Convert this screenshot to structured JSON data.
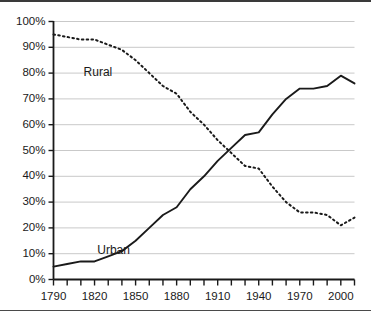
{
  "chart_data": {
    "type": "line",
    "title": "",
    "subtitle": "",
    "xlabel": "",
    "ylabel": "",
    "xlim": [
      1790,
      2010
    ],
    "ylim": [
      0,
      100
    ],
    "grid": true,
    "legend_position": "inline-annotations",
    "x_tick_labels": [
      "1790",
      "1820",
      "1850",
      "1880",
      "1910",
      "1940",
      "1970",
      "2000"
    ],
    "x_tick_label_values": [
      1790,
      1820,
      1850,
      1880,
      1910,
      1940,
      1970,
      2000
    ],
    "x_minor_ticks": [
      1790,
      1800,
      1810,
      1820,
      1830,
      1840,
      1850,
      1860,
      1870,
      1880,
      1890,
      1900,
      1910,
      1920,
      1930,
      1940,
      1950,
      1960,
      1970,
      1980,
      1990,
      2000,
      2010
    ],
    "y_tick_labels": [
      "0%",
      "10%",
      "20%",
      "30%",
      "40%",
      "50%",
      "60%",
      "70%",
      "80%",
      "90%",
      "100%"
    ],
    "y_tick_values": [
      0,
      10,
      20,
      30,
      40,
      50,
      60,
      70,
      80,
      90,
      100
    ],
    "x": [
      1790,
      1800,
      1810,
      1820,
      1830,
      1840,
      1850,
      1860,
      1870,
      1880,
      1890,
      1900,
      1910,
      1920,
      1930,
      1940,
      1950,
      1960,
      1970,
      1980,
      1990,
      2000,
      2010
    ],
    "series": [
      {
        "name": "Urban",
        "style": "solid",
        "color": "#1a1a1a",
        "label_x": 1822,
        "label_y": 11,
        "values": [
          5,
          6,
          7,
          7,
          9,
          11,
          15,
          20,
          25,
          28,
          35,
          40,
          46,
          51,
          56,
          57,
          64,
          70,
          74,
          74,
          75,
          79,
          76
        ]
      },
      {
        "name": "Rural",
        "style": "dotted",
        "color": "#1a1a1a",
        "label_x": 1812,
        "label_y": 80,
        "values": [
          95,
          94,
          93,
          93,
          91,
          89,
          85,
          80,
          75,
          72,
          65,
          60,
          54,
          49,
          44,
          43,
          36,
          30,
          26,
          26,
          25,
          21,
          24
        ]
      }
    ]
  }
}
